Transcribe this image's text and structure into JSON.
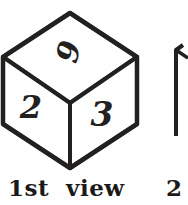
{
  "figure": {
    "title": "1st view",
    "background_color": "#ffffff",
    "ink_color": "#23211f",
    "primary_cube": {
      "name": "isometric-cube",
      "faces": [
        {
          "position": "top",
          "digit": "6",
          "rotation_deg": 105
        },
        {
          "position": "left",
          "digit": "2",
          "rotation_deg": 0
        },
        {
          "position": "right",
          "digit": "3",
          "rotation_deg": 0
        }
      ],
      "vertices": {
        "top": [
          70,
          13
        ],
        "left": [
          3,
          57
        ],
        "right": [
          137,
          57
        ],
        "center": [
          70,
          103
        ],
        "bottom": [
          70,
          168
        ],
        "left_bottom": [
          3,
          124
        ],
        "right_bottom": [
          137,
          124
        ]
      }
    },
    "secondary_cube": {
      "name": "partial-cube-right",
      "clipped": true,
      "visible_edge": {
        "x": 176,
        "y_top": 48,
        "y_bottom": 136
      }
    }
  },
  "captions": {
    "main": "1st  view",
    "next_label": "2"
  }
}
